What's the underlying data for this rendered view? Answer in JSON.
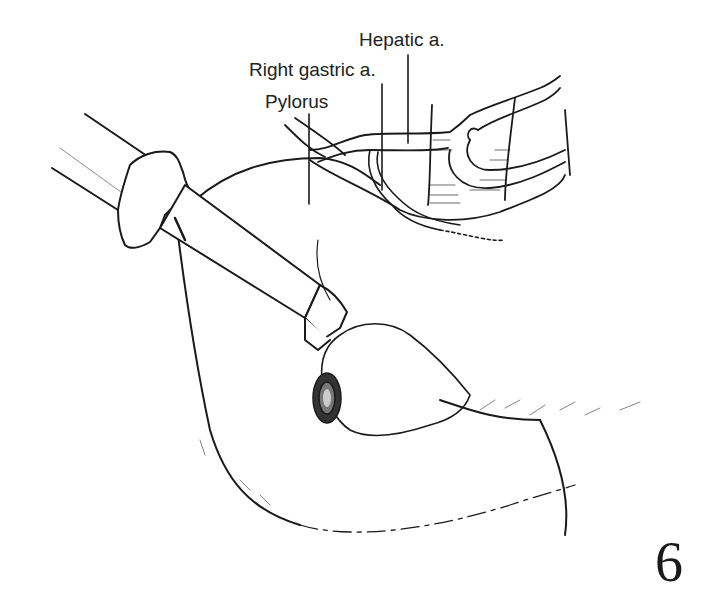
{
  "figure": {
    "number": "6",
    "labels": [
      {
        "id": "hepatic",
        "text": "Hepatic a."
      },
      {
        "id": "right-gastric",
        "text": "Right gastric a."
      },
      {
        "id": "pylorus",
        "text": "Pylorus"
      }
    ]
  },
  "colors": {
    "ink": "#1a1a1a",
    "background": "#ffffff"
  }
}
